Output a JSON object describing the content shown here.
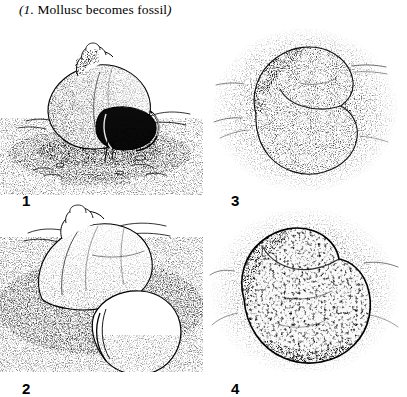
{
  "caption": {
    "open_paren_number": "(1.",
    "text": "Mollusc becomes fossil",
    "close_paren": ")",
    "full": "(1. Mollusc becomes fossil)"
  },
  "colors": {
    "background": "#ffffff",
    "ink": "#000000",
    "stipple": "#1a1a1a",
    "shell_fill": "#ffffff"
  },
  "figure": {
    "panel_count": 4,
    "grid": "2x2",
    "panels": [
      {
        "number": "1",
        "name": "panel-shell-on-seafloor",
        "label": "1",
        "description": "Intact gastropod shell resting on sandy seafloor, aperture facing right",
        "medium": "pen-and-ink stipple drawing"
      },
      {
        "number": "3",
        "name": "panel-shell-buried-in-sediment",
        "label": "3",
        "description": "Shell outline faintly visible, fully enclosed by dense stippled sediment",
        "medium": "pen-and-ink stipple drawing"
      },
      {
        "number": "2",
        "name": "panel-shell-partly-covered",
        "label": "2",
        "description": "Shell partially covered by accumulating sediment, aperture at lower right",
        "medium": "pen-and-ink stipple drawing"
      },
      {
        "number": "4",
        "name": "panel-fossil-in-rock",
        "label": "4",
        "description": "Fossil preserved as mottled mass within consolidated rock matrix",
        "medium": "pen-and-ink stipple drawing"
      }
    ]
  }
}
